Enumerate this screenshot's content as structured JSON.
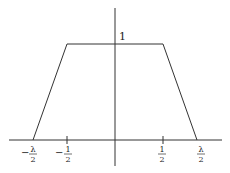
{
  "diagram": {
    "type": "trapezoid-function-plot",
    "stroke_color": "#333333",
    "plateau_label": "1",
    "vertices": [
      {
        "x": "-λ/2",
        "y": 0
      },
      {
        "x": "-1/2",
        "y": 1
      },
      {
        "x": "1/2",
        "y": 1
      },
      {
        "x": "λ/2",
        "y": 0
      }
    ],
    "ticks": [
      {
        "id": "neg-lambda-half",
        "sign": "−",
        "num": "λ",
        "den": "2"
      },
      {
        "id": "neg-half",
        "sign": "−",
        "num": "1",
        "den": "2"
      },
      {
        "id": "half",
        "sign": "",
        "num": "1",
        "den": "2"
      },
      {
        "id": "lambda-half",
        "sign": "",
        "num": "λ",
        "den": "2"
      }
    ]
  }
}
